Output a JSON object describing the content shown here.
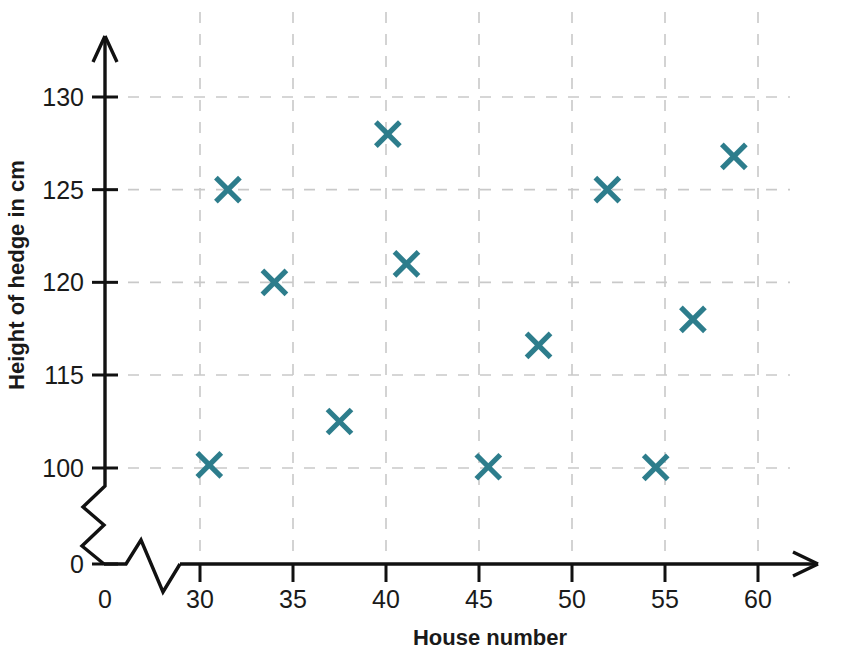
{
  "chart_data": {
    "type": "scatter",
    "title": "",
    "xlabel": "House number",
    "ylabel": "Height of hedge in cm",
    "x_ticks": [
      0,
      30,
      35,
      40,
      45,
      50,
      55,
      60
    ],
    "y_ticks": [
      0,
      100,
      115,
      120,
      125,
      130
    ],
    "x_tick_labels": [
      "0",
      "30",
      "35",
      "40",
      "45",
      "50",
      "55",
      "60"
    ],
    "y_tick_labels": [
      "0",
      "100",
      "115",
      "120",
      "125",
      "130"
    ],
    "xlim": [
      30,
      62
    ],
    "ylim": [
      100,
      133
    ],
    "grid": true,
    "x_axis_broken": true,
    "y_axis_broken": true,
    "legend": null,
    "marker": "x",
    "marker_color": "#2d7d8c",
    "grid_color": "#c9c9c9",
    "axis_color": "#111111",
    "points": [
      {
        "x": 30.5,
        "y": 100.5
      },
      {
        "x": 31.5,
        "y": 125.0
      },
      {
        "x": 34.0,
        "y": 120.0
      },
      {
        "x": 37.5,
        "y": 107.5
      },
      {
        "x": 40.1,
        "y": 128.0
      },
      {
        "x": 41.1,
        "y": 121.0
      },
      {
        "x": 45.5,
        "y": 100.2
      },
      {
        "x": 48.2,
        "y": 116.6
      },
      {
        "x": 51.9,
        "y": 125.0
      },
      {
        "x": 54.5,
        "y": 100.1
      },
      {
        "x": 56.5,
        "y": 118.0
      },
      {
        "x": 58.7,
        "y": 126.8
      }
    ]
  },
  "axes": {
    "x_title": "House number",
    "y_title": "Height of hedge in cm"
  }
}
